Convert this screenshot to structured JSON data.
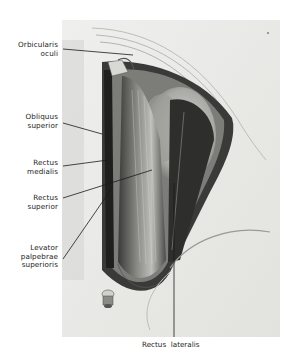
{
  "figure": {
    "labels": [
      {
        "id": "orbicularis-oculi",
        "lines": [
          "Orbicularis",
          "oculi"
        ]
      },
      {
        "id": "obliquus-superior",
        "lines": [
          "Obliquus",
          "superior"
        ]
      },
      {
        "id": "rectus-medialis",
        "lines": [
          "Rectus",
          "medialis"
        ]
      },
      {
        "id": "rectus-superior",
        "lines": [
          "Rectus",
          "superior"
        ]
      },
      {
        "id": "levator-palpebrae-superioris",
        "lines": [
          "Levator",
          "palpebrae",
          "superioris"
        ]
      }
    ],
    "bottom_label": "Rectus  lateralis"
  },
  "colors": {
    "background": "#ffffff",
    "plate": "#e9e9e7",
    "muscle_dark": "#2a2a2a",
    "muscle_mid": "#7a7a78",
    "eyeball": "#b9b9b6",
    "leader_line": "#1a1a1a"
  }
}
